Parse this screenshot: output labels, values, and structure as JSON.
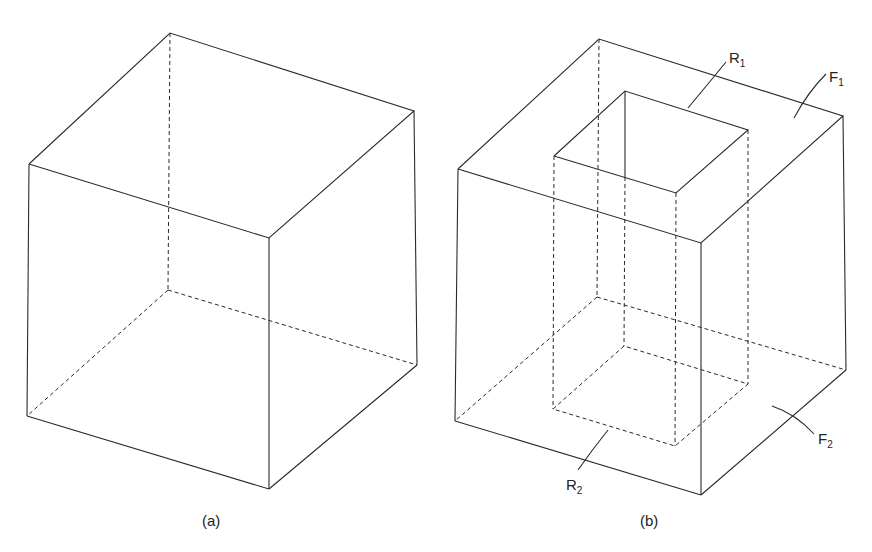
{
  "figure": {
    "panels": [
      {
        "id": "a",
        "caption": "(a)",
        "description": "plain cube with hidden edges dashed"
      },
      {
        "id": "b",
        "caption": "(b)",
        "description": "cube with a square through-hole"
      }
    ],
    "labels": {
      "R1": {
        "main": "R",
        "sub": "1"
      },
      "F1": {
        "main": "F",
        "sub": "1"
      },
      "R2": {
        "main": "R",
        "sub": "2"
      },
      "F2": {
        "main": "F",
        "sub": "2"
      }
    }
  }
}
